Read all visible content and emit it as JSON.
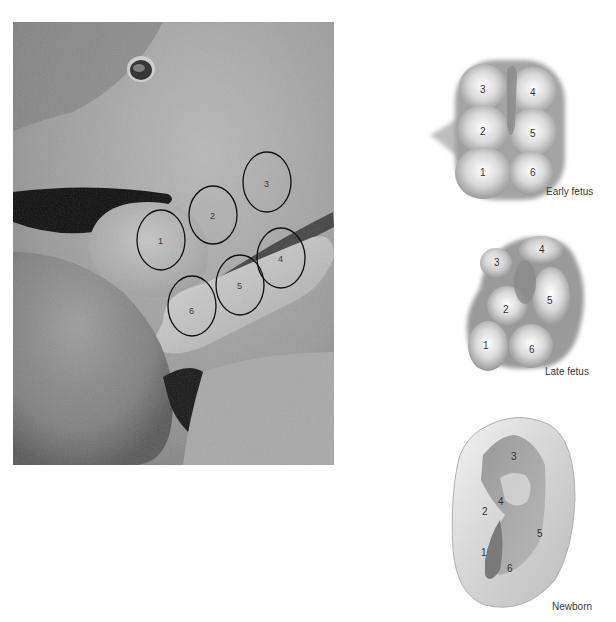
{
  "figure": {
    "photo": {
      "description": "Scanning electron micrograph of embryonic auricular hillocks",
      "hillocks": [
        {
          "label": "1",
          "cx": 148,
          "cy": 218,
          "rx": 24,
          "ry": 30
        },
        {
          "label": "2",
          "cx": 200,
          "cy": 193,
          "rx": 24,
          "ry": 29
        },
        {
          "label": "3",
          "cx": 254,
          "cy": 160,
          "rx": 24,
          "ry": 30
        },
        {
          "label": "4",
          "cx": 268,
          "cy": 236,
          "rx": 24,
          "ry": 30
        },
        {
          "label": "5",
          "cx": 227,
          "cy": 263,
          "rx": 24,
          "ry": 30
        },
        {
          "label": "6",
          "cx": 179,
          "cy": 284,
          "rx": 24,
          "ry": 30
        }
      ]
    },
    "stages": [
      {
        "caption": "Early fetus",
        "labels": [
          "1",
          "2",
          "3",
          "4",
          "5",
          "6"
        ]
      },
      {
        "caption": "Late fetus",
        "labels": [
          "1",
          "2",
          "3",
          "4",
          "5",
          "6"
        ]
      },
      {
        "caption": "Newborn",
        "labels": [
          "1",
          "2",
          "3",
          "4",
          "5",
          "6"
        ]
      }
    ]
  }
}
